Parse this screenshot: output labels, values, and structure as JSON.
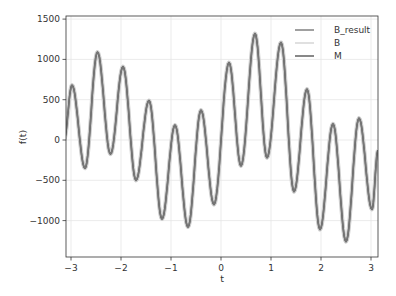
{
  "chart_data": {
    "type": "line",
    "title": "",
    "xlabel": "t",
    "ylabel": "f(t)",
    "xlim": [
      -3.14,
      3.14
    ],
    "ylim": [
      -1450,
      1530
    ],
    "grid": true,
    "legend_position": "upper right",
    "xticks": [
      -3,
      -2,
      -1,
      0,
      1,
      2,
      3
    ],
    "xtick_labels": [
      "−3",
      "−2",
      "−1",
      "0",
      "1",
      "2",
      "3"
    ],
    "yticks": [
      -1000,
      -500,
      0,
      500,
      1000,
      1500
    ],
    "ytick_labels": [
      "−1000",
      "−500",
      "0",
      "500",
      "1000",
      "1500"
    ],
    "series": [
      {
        "name": "B_result",
        "color": "#777777",
        "width": 1.4
      },
      {
        "name": "B",
        "color": "#cccccc",
        "width": 4
      },
      {
        "name": "M",
        "color": "#555555",
        "width": 1.6
      }
    ],
    "x": [
      -3.14,
      -2.98,
      -2.72,
      -2.47,
      -2.21,
      -1.96,
      -1.7,
      -1.44,
      -1.18,
      -0.92,
      -0.66,
      -0.4,
      -0.14,
      0.16,
      0.4,
      0.68,
      0.92,
      1.2,
      1.46,
      1.72,
      1.98,
      2.24,
      2.5,
      2.76,
      3.02,
      3.14
    ],
    "values": [
      0,
      680,
      -350,
      1090,
      -175,
      910,
      -500,
      490,
      -980,
      185,
      -1080,
      370,
      -800,
      960,
      -320,
      1320,
      -220,
      1210,
      -640,
      630,
      -1110,
      200,
      -1260,
      270,
      -860,
      -130
    ]
  }
}
